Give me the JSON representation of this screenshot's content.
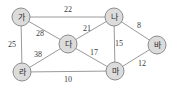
{
  "diagram": {
    "type": "weighted-undirected-graph",
    "nodes": [
      {
        "id": "ga",
        "label": "가",
        "x": 21,
        "y": 17
      },
      {
        "id": "na",
        "label": "나",
        "x": 114,
        "y": 17
      },
      {
        "id": "da",
        "label": "다",
        "x": 68,
        "y": 44
      },
      {
        "id": "ra",
        "label": "라",
        "x": 22,
        "y": 72
      },
      {
        "id": "ma",
        "label": "마",
        "x": 115,
        "y": 71
      },
      {
        "id": "ba",
        "label": "바",
        "x": 157,
        "y": 45
      }
    ],
    "edges": [
      {
        "from": "ga",
        "to": "na",
        "weight": "22",
        "lx": 68,
        "ly": 9
      },
      {
        "from": "ga",
        "to": "da",
        "weight": "28",
        "lx": 40,
        "ly": 33
      },
      {
        "from": "ga",
        "to": "ra",
        "weight": "25",
        "lx": 12,
        "ly": 44
      },
      {
        "from": "na",
        "to": "da",
        "weight": "21",
        "lx": 87,
        "ly": 28
      },
      {
        "from": "na",
        "to": "ma",
        "weight": "15",
        "lx": 119,
        "ly": 43
      },
      {
        "from": "na",
        "to": "ba",
        "weight": "8",
        "lx": 139,
        "ly": 25
      },
      {
        "from": "da",
        "to": "ra",
        "weight": "38",
        "lx": 38,
        "ly": 54
      },
      {
        "from": "da",
        "to": "ma",
        "weight": "17",
        "lx": 94,
        "ly": 52
      },
      {
        "from": "ra",
        "to": "ma",
        "weight": "10",
        "lx": 68,
        "ly": 79
      },
      {
        "from": "ma",
        "to": "ba",
        "weight": "12",
        "lx": 142,
        "ly": 63
      }
    ]
  },
  "colors": {
    "node_fill": "#dcdcdc",
    "node_stroke": "#8c8c8c",
    "edge_stroke": "#9a9a9a",
    "label_text": "#2b2b2b",
    "weight_text": "#3a3a3a",
    "background": "#ffffff"
  }
}
